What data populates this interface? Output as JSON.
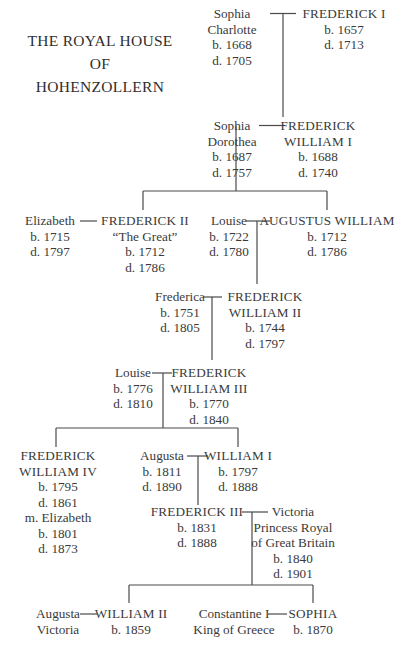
{
  "title": {
    "line1": "THE ROYAL HOUSE",
    "line2": "OF",
    "line3": "HOHENZOLLERN"
  },
  "people": {
    "sophia_charlotte": {
      "lines": [
        "Sophia",
        "Charlotte",
        "b. 1668",
        "d. 1705"
      ]
    },
    "frederick_i": {
      "lines": [
        "FREDERICK I",
        "b. 1657",
        "d. 1713"
      ]
    },
    "sophia_dorothea": {
      "lines": [
        "Sophia",
        "Dorothea",
        "b. 1687",
        "d. 1757"
      ]
    },
    "frederick_william_i": {
      "lines": [
        "FREDERICK",
        "WILLIAM I",
        "b. 1688",
        "d. 1740"
      ]
    },
    "elizabeth": {
      "lines": [
        "Elizabeth",
        "b. 1715",
        "d. 1797"
      ]
    },
    "frederick_ii": {
      "lines": [
        "FREDERICK II",
        "“The Great”",
        "b. 1712",
        "d. 1786"
      ]
    },
    "louise_1": {
      "lines": [
        "Louise",
        "b. 1722",
        "d. 1780"
      ]
    },
    "augustus_william": {
      "lines": [
        "AUGUSTUS WILLIAM",
        "b. 1712",
        "d. 1786"
      ]
    },
    "frederica": {
      "lines": [
        "Frederica",
        "b. 1751",
        "d. 1805"
      ]
    },
    "frederick_william_ii": {
      "lines": [
        "FREDERICK",
        "WILLIAM II",
        "b. 1744",
        "d. 1797"
      ]
    },
    "louise_2": {
      "lines": [
        "Louise",
        "b. 1776",
        "d. 1810"
      ]
    },
    "frederick_william_iii": {
      "lines": [
        "FREDERICK",
        "WILLIAM III",
        "b. 1770",
        "d. 1840"
      ]
    },
    "frederick_william_iv": {
      "lines": [
        "FREDERICK",
        "WILLIAM IV",
        "b. 1795",
        "d. 1861",
        "m. Elizabeth",
        "b. 1801",
        "d. 1873"
      ]
    },
    "augusta": {
      "lines": [
        "Augusta",
        "b. 1811",
        "d. 1890"
      ]
    },
    "william_i": {
      "lines": [
        "WILLIAM I",
        "b. 1797",
        "d. 1888"
      ]
    },
    "frederick_iii": {
      "lines": [
        "FREDERICK III",
        "b. 1831",
        "d. 1888"
      ]
    },
    "victoria": {
      "lines": [
        "Victoria",
        "Princess Royal",
        "of Great Britain",
        "b. 1840",
        "d. 1901"
      ]
    },
    "augusta_victoria": {
      "lines": [
        "Augusta",
        "Victoria"
      ]
    },
    "william_ii": {
      "lines": [
        "WILLIAM II",
        "b. 1859"
      ]
    },
    "constantine_i": {
      "lines": [
        "Constantine I",
        "King of Greece"
      ]
    },
    "sophia": {
      "lines": [
        "SOPHIA",
        "b. 1870"
      ]
    }
  },
  "colors": {
    "text": "#3a3a3a",
    "lines": "#4a4a4a",
    "background": "#ffffff"
  }
}
